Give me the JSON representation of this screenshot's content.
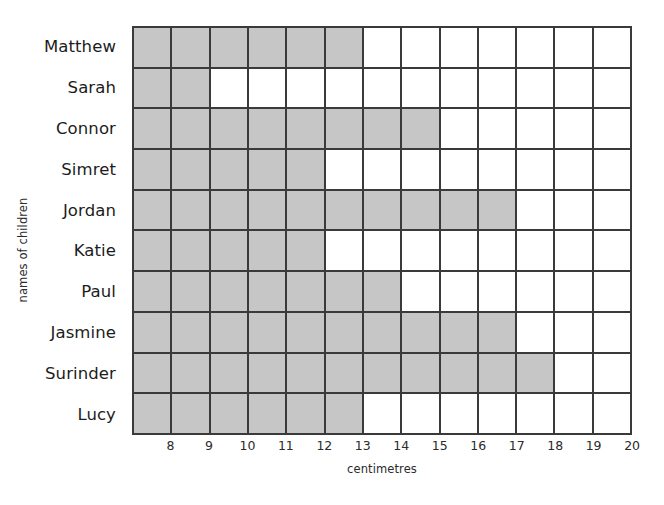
{
  "chart_data": {
    "type": "bar",
    "orientation": "horizontal",
    "title": "",
    "xlabel": "centimetres",
    "ylabel": "names of children",
    "categories": [
      "Matthew",
      "Sarah",
      "Connor",
      "Simret",
      "Jordan",
      "Katie",
      "Paul",
      "Jasmine",
      "Surinder",
      "Lucy"
    ],
    "values": [
      13,
      9,
      15,
      12,
      17,
      12,
      14,
      17,
      18,
      13
    ],
    "x_tick_labels": [
      "8",
      "9",
      "10",
      "11",
      "12",
      "13",
      "14",
      "15",
      "16",
      "17",
      "18",
      "19",
      "20"
    ],
    "xlim": [
      7,
      20
    ],
    "grid": true,
    "legend": null,
    "bar_color": "#c6c6c6",
    "grid_line_color": "#3a3a3a"
  },
  "axis": {
    "y_title": "names of children",
    "x_title": "centimetres"
  },
  "rows": [
    {
      "name": "Matthew",
      "value": 13
    },
    {
      "name": "Sarah",
      "value": 9
    },
    {
      "name": "Connor",
      "value": 15
    },
    {
      "name": "Simret",
      "value": 12
    },
    {
      "name": "Jordan",
      "value": 17
    },
    {
      "name": "Katie",
      "value": 12
    },
    {
      "name": "Paul",
      "value": 14
    },
    {
      "name": "Jasmine",
      "value": 17
    },
    {
      "name": "Surinder",
      "value": 18
    },
    {
      "name": "Lucy",
      "value": 13
    }
  ]
}
